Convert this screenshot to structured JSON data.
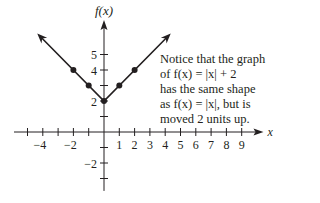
{
  "chart_data": {
    "type": "line",
    "title": "",
    "xlabel": "x",
    "ylabel": "f(x)",
    "function": "f(x) = |x| + 2",
    "xlim": [
      -5.5,
      10
    ],
    "ylim": [
      -3.5,
      7
    ],
    "x_tick_labels": [
      "-4",
      "-2",
      "1",
      "2",
      "3",
      "4",
      "5",
      "6",
      "7",
      "8",
      "9"
    ],
    "y_tick_labels": [
      "5",
      "4",
      "2",
      "-2"
    ],
    "series": [
      {
        "name": "f(x) = |x| + 2",
        "points": [
          {
            "x": -3,
            "y": 5
          },
          {
            "x": -2,
            "y": 4
          },
          {
            "x": -1,
            "y": 3
          },
          {
            "x": 0,
            "y": 2
          },
          {
            "x": 1,
            "y": 3
          },
          {
            "x": 2,
            "y": 4
          },
          {
            "x": 3,
            "y": 5
          }
        ],
        "marked_points": [
          {
            "x": -2,
            "y": 4
          },
          {
            "x": -1,
            "y": 3
          },
          {
            "x": 0,
            "y": 2
          },
          {
            "x": 1,
            "y": 3
          },
          {
            "x": 2,
            "y": 4
          }
        ],
        "arrows_at_ends": true
      }
    ],
    "grid": false,
    "annotations": [
      "Notice that the graph of f(x) = |x| + 2 has the same shape as f(x) = |x|, but is moved 2 units up."
    ]
  },
  "axis": {
    "x_label": "x",
    "y_label": "f(x)",
    "x_ticks": [
      {
        "v": -4,
        "label": "−4"
      },
      {
        "v": -2,
        "label": "−2"
      },
      {
        "v": 1,
        "label": "1"
      },
      {
        "v": 2,
        "label": "2"
      },
      {
        "v": 3,
        "label": "3"
      },
      {
        "v": 4,
        "label": "4"
      },
      {
        "v": 5,
        "label": "5"
      },
      {
        "v": 6,
        "label": "6"
      },
      {
        "v": 7,
        "label": "7"
      },
      {
        "v": 8,
        "label": "8"
      },
      {
        "v": 9,
        "label": "9"
      }
    ],
    "y_ticks": [
      {
        "v": 5,
        "label": "5"
      },
      {
        "v": 4,
        "label": "4"
      },
      {
        "v": 2,
        "label": "2"
      },
      {
        "v": -2,
        "label": "−2"
      }
    ]
  },
  "note": {
    "line1": "Notice that the graph",
    "line2": "of f(x) = |x| + 2",
    "line3": "has the same shape",
    "line4": "as f(x) = |x|, but is",
    "line5": "moved 2 units up."
  },
  "colors": {
    "ink": "#231f20",
    "background": "#ffffff"
  }
}
